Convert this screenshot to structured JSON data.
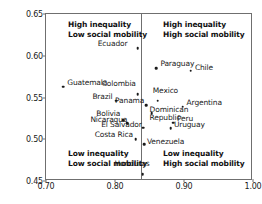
{
  "chart_data": {
    "type": "scatter",
    "title": "",
    "xlabel": "",
    "ylabel": "Adjusted Gini coefficient (0–1 scale)",
    "xlim": [
      0.7,
      1.0
    ],
    "ylim": [
      0.45,
      0.65
    ],
    "xticks": [
      "0.70",
      "0.80",
      "0.90",
      "1.00"
    ],
    "xtick_values": [
      0.7,
      0.8,
      0.9,
      1.0
    ],
    "yticks": [
      "0.45",
      "0.50",
      "0.55",
      "0.60",
      "0.65"
    ],
    "ytick_values": [
      0.45,
      0.5,
      0.55,
      0.6,
      0.65
    ],
    "grid": false,
    "legend": "none",
    "divider_x": 0.838,
    "annotations": [
      {
        "position": "top-left",
        "line1": "High inequality",
        "line2": "Low social mobility"
      },
      {
        "position": "top-right",
        "line1": "High inequality",
        "line2": "High social mobility"
      },
      {
        "position": "bottom-left",
        "line1": "Low inequality",
        "line2": "Low social mobility"
      },
      {
        "position": "bottom-right",
        "line1": "Low inequality",
        "line2": "High social mobility"
      }
    ],
    "points": [
      {
        "name": "Ecuador",
        "x": 0.833,
        "y": 0.609,
        "label_dx": -40,
        "label_dy": -4
      },
      {
        "name": "Paraguay",
        "x": 0.86,
        "y": 0.585,
        "label_dx": 4,
        "label_dy": -4
      },
      {
        "name": "Chile",
        "x": 0.91,
        "y": 0.582,
        "label_dx": 4,
        "label_dy": -3
      },
      {
        "name": "Guatemala",
        "x": 0.725,
        "y": 0.563,
        "label_dx": 4,
        "label_dy": -4
      },
      {
        "name": "Colombia",
        "x": 0.833,
        "y": 0.554,
        "label_dx": -36,
        "label_dy": -10
      },
      {
        "name": "Brazil",
        "x": 0.802,
        "y": 0.546,
        "label_dx": -24,
        "label_dy": -4
      },
      {
        "name": "Mexico",
        "x": 0.862,
        "y": 0.546,
        "label_dx": -5,
        "label_dy": -10
      },
      {
        "name": "Panama",
        "x": 0.845,
        "y": 0.541,
        "label_dx": -31,
        "label_dy": -4
      },
      {
        "name": "Argentina",
        "x": 0.898,
        "y": 0.539,
        "label_dx": 4,
        "label_dy": -4
      },
      {
        "name": "Dominican Republic",
        "x": 0.853,
        "y": 0.531,
        "label_dx": -2,
        "label_dy": -3
      },
      {
        "name": "Bolivia",
        "x": 0.812,
        "y": 0.523,
        "label_dx": -27,
        "label_dy": -6
      },
      {
        "name": "Peru",
        "x": 0.884,
        "y": 0.52,
        "label_dx": 4,
        "label_dy": -4
      },
      {
        "name": "Nicaragua",
        "x": 0.818,
        "y": 0.519,
        "label_dx": -37,
        "label_dy": -3
      },
      {
        "name": "Uruguay",
        "x": 0.881,
        "y": 0.513,
        "label_dx": 3,
        "label_dy": -3
      },
      {
        "name": "El Salvador",
        "x": 0.841,
        "y": 0.514,
        "label_dx": -42,
        "label_dy": -3
      },
      {
        "name": "Costa Rica",
        "x": 0.83,
        "y": 0.5,
        "label_dx": -41,
        "label_dy": -4
      },
      {
        "name": "Venezuela",
        "x": 0.842,
        "y": 0.494,
        "label_dx": 3,
        "label_dy": -2
      },
      {
        "name": "Honduras",
        "x": 0.84,
        "y": 0.458,
        "label_dx": -28,
        "label_dy": -10
      }
    ]
  }
}
